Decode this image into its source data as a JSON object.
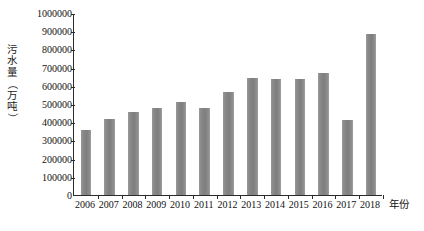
{
  "chart_data": {
    "type": "bar",
    "title": "",
    "xlabel": "年份",
    "ylabel": "污水量（万吨）",
    "ylabel_chars": [
      "污",
      "水",
      "量",
      "（",
      "万",
      "吨",
      "）"
    ],
    "categories": [
      "2006",
      "2007",
      "2008",
      "2009",
      "2010",
      "2011",
      "2012",
      "2013",
      "2014",
      "2015",
      "2016",
      "2017",
      "2018"
    ],
    "values": [
      355000,
      415000,
      455000,
      480000,
      510000,
      478000,
      565000,
      645000,
      640000,
      638000,
      670000,
      412000,
      885000
    ],
    "ylim": [
      0,
      1000000
    ],
    "ytick_values": [
      0,
      100000,
      200000,
      300000,
      400000,
      500000,
      600000,
      700000,
      800000,
      900000,
      1000000
    ],
    "ytick_labels": [
      "0",
      "100000",
      "200000",
      "300000",
      "400000",
      "500000",
      "600000",
      "700000",
      "800000",
      "900000",
      "1000000"
    ],
    "grid": false,
    "legend": null,
    "bar_color": "#858585",
    "axis_color": "#2b2b2b",
    "background_color": "#ffffff"
  }
}
